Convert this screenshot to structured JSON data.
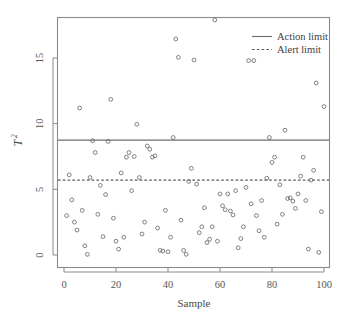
{
  "chart_data": {
    "type": "scatter",
    "title": "",
    "xlabel": "Sample",
    "ylabel": "T²",
    "ylabel_base": "T",
    "ylabel_exponent": "2",
    "xlim": [
      -2,
      102
    ],
    "ylim": [
      -0.6,
      18.6
    ],
    "xticks": [
      0,
      20,
      40,
      60,
      80,
      100
    ],
    "yticks": [
      0,
      5,
      10,
      15
    ],
    "xtick_labels": [
      "0",
      "20",
      "40",
      "60",
      "80",
      "100"
    ],
    "ytick_labels": [
      "0",
      "5",
      "10",
      "15"
    ],
    "grid": false,
    "marker": "open-circle",
    "marker_color": "#6b6b6b",
    "legend_position": "top-right",
    "legend": [
      {
        "label": "Action limit",
        "style": "solid",
        "color": "#6e6e6e"
      },
      {
        "label": "Alert limit",
        "style": "dotted",
        "color": "#5a5a5a"
      }
    ],
    "reference_lines": [
      {
        "name": "Action limit",
        "value": 8.75,
        "style": "solid"
      },
      {
        "name": "Alert limit",
        "value": 5.7,
        "style": "dotted"
      }
    ],
    "x": [
      1,
      2,
      3,
      4,
      5,
      6,
      7,
      8,
      9,
      10,
      11,
      12,
      13,
      14,
      15,
      16,
      17,
      18,
      19,
      20,
      21,
      22,
      23,
      24,
      25,
      26,
      27,
      28,
      29,
      30,
      31,
      32,
      33,
      34,
      35,
      36,
      37,
      38,
      39,
      40,
      41,
      42,
      43,
      44,
      45,
      46,
      47,
      48,
      49,
      50,
      51,
      52,
      53,
      54,
      55,
      56,
      57,
      58,
      59,
      60,
      61,
      62,
      63,
      64,
      65,
      66,
      67,
      68,
      69,
      70,
      71,
      72,
      73,
      74,
      75,
      76,
      77,
      78,
      79,
      80,
      81,
      82,
      83,
      84,
      85,
      86,
      87,
      88,
      89,
      90,
      91,
      92,
      93,
      94,
      95,
      96,
      97,
      98,
      99,
      100
    ],
    "y": [
      3.0,
      6.1,
      4.2,
      2.5,
      1.9,
      11.2,
      3.4,
      0.7,
      0.05,
      5.9,
      8.7,
      7.8,
      3.1,
      5.3,
      1.4,
      4.6,
      8.65,
      11.85,
      2.8,
      1.05,
      0.45,
      6.25,
      1.35,
      7.45,
      7.8,
      4.9,
      7.5,
      9.95,
      5.9,
      1.6,
      2.5,
      8.3,
      8.05,
      7.45,
      7.55,
      2.05,
      0.35,
      0.3,
      3.4,
      0.25,
      1.35,
      8.95,
      16.45,
      15.05,
      2.65,
      0.35,
      0.05,
      5.6,
      6.6,
      14.85,
      5.4,
      1.7,
      2.15,
      3.6,
      0.95,
      1.2,
      2.15,
      17.9,
      1.05,
      4.65,
      3.75,
      3.45,
      4.65,
      3.35,
      3.05,
      4.9,
      0.55,
      1.25,
      2.15,
      5.15,
      14.8,
      3.9,
      14.8,
      3.0,
      1.85,
      4.15,
      1.35,
      5.85,
      8.95,
      7.05,
      7.45,
      2.35,
      5.35,
      3.1,
      9.5,
      4.3,
      4.35,
      4.1,
      3.55,
      4.65,
      6.0,
      7.45,
      4.15,
      0.45,
      5.7,
      6.45,
      13.1,
      0.2,
      3.3,
      11.3,
      1.3
    ]
  }
}
